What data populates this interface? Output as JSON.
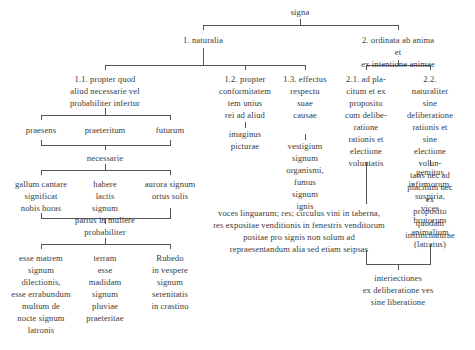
{
  "diagram": {
    "type": "tree",
    "root": "signa",
    "nodes": {
      "signa": "signa",
      "n1": "1. naturalia",
      "n2": "2. ordinata ab anima et\nex intentione animae",
      "n11": "1.1. propter quod\naliud necessarie vel\nprobabiliter infertur",
      "n12": "1.2. propter\nconformitatem\ntem unius\nrei ad aliud",
      "n12_ex": "imaginus\npicturae",
      "n13": "1.3. effectus\nrespectu\nsuae\ncausae",
      "n13_ex": "vestigium\nsignum\norganismi,\nfumus\nsignum\nignis",
      "n21": "2.1. ad pla-\ncitum et ex\nproposito\ncum delibe-\nratione\nrationis et\nelectione\nvoluntatis",
      "n22": "2.2. naturaliter\nsine deliberatione\nrationis et sine\nelectione volun-\ntatis nec ad\nplacitum nec ex\nproposito quodam\ninstincnaturae",
      "n22_ex": "gemitus\ninfirmorum,\nsuspiria,\nvices brutorum\nanimalium\n(latratus)",
      "praesens": "praesens",
      "praeteritum": "praeteritum",
      "futurum": "futurum",
      "necessarie": "necessarie",
      "nec_ex1": "gallum cantare\nsignificat\nnobis horas",
      "nec_ex2": "habere\nlactis\nsignum\npartus in muliere",
      "nec_ex3": "aurora signum\nortus solis",
      "probabiliter": "probabiliter",
      "prob_ex1": "esse matrem\nsignum\ndilectionis,\nesse errabundum\nmultum de\nnocte signum\nlatronis",
      "prob_ex2": "terram\nesse\nmadidam\nsignum\npluviae\npraeteritae",
      "prob_ex3": "Rubedo\nin vespere\nsignum\nserenitatis\nin crastino",
      "n21_ex": "voces linguarum; res; circulus vini in taberna,\nres expositae venditionis in fenestris venditorum\npositae pro signis non solum ad\nrepraesentandum alia sed etiam seipsas",
      "interiectiones": "interiectiones\nex deliberatione ves\nsine liberatione"
    }
  }
}
